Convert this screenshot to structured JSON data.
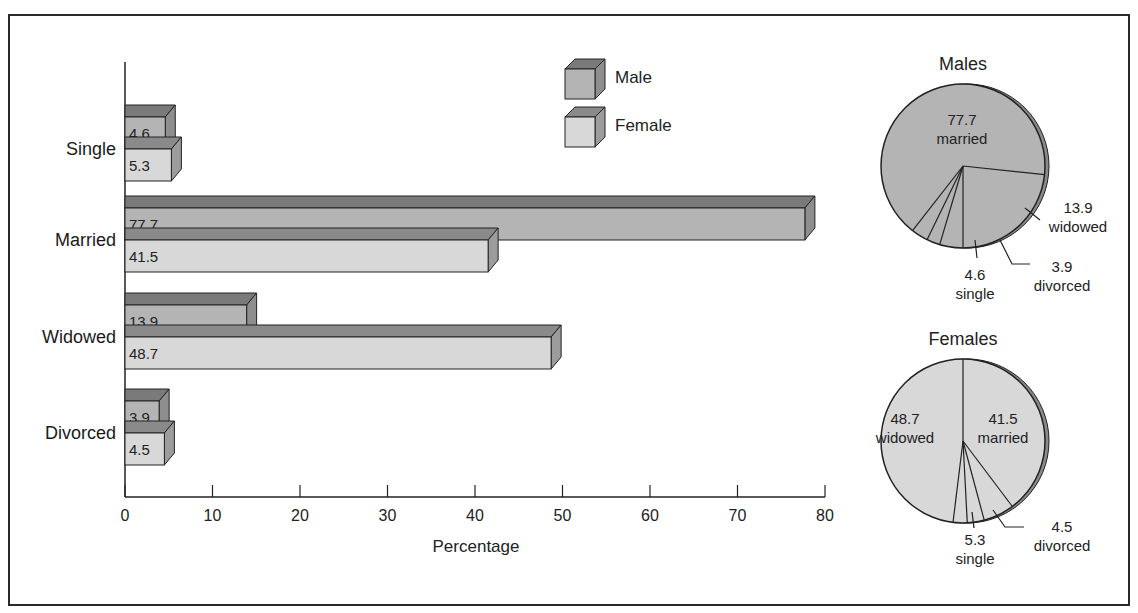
{
  "chart_data": [
    {
      "type": "bar",
      "orientation": "horizontal",
      "style": "3d",
      "categories": [
        "Single",
        "Married",
        "Widowed",
        "Divorced"
      ],
      "series": [
        {
          "name": "Male",
          "values": [
            4.6,
            77.7,
            13.9,
            3.9
          ],
          "color": "#b4b4b4",
          "top_color": "#7a7a7a",
          "side_color": "#8e8e8e"
        },
        {
          "name": "Female",
          "values": [
            5.3,
            41.5,
            48.7,
            4.5
          ],
          "color": "#d8d8d8",
          "top_color": "#8a8a8a",
          "side_color": "#9c9c9c"
        }
      ],
      "value_labels": {
        "Male": [
          "4.6",
          "77.7",
          "13.9",
          "3.9"
        ],
        "Female": [
          "5.3",
          "41.5",
          "48.7",
          "4.5"
        ]
      },
      "xlabel": "Percentage",
      "ylabel": "",
      "xlim": [
        0,
        80
      ],
      "xticks": [
        "0",
        "10",
        "20",
        "30",
        "40",
        "50",
        "60",
        "70",
        "80"
      ],
      "grid": false,
      "legend": {
        "position": "top-center",
        "entries": [
          "Male",
          "Female"
        ]
      }
    },
    {
      "type": "pie",
      "title": "Males",
      "slices": [
        {
          "label": "married",
          "value": 77.7,
          "text": "77.7"
        },
        {
          "label": "widowed",
          "value": 13.9,
          "text": "13.9"
        },
        {
          "label": "divorced",
          "value": 3.9,
          "text": "3.9"
        },
        {
          "label": "single",
          "value": 4.6,
          "text": "4.6"
        }
      ],
      "color": "#b4b4b4"
    },
    {
      "type": "pie",
      "title": "Females",
      "slices": [
        {
          "label": "married",
          "value": 41.5,
          "text": "41.5"
        },
        {
          "label": "divorced",
          "value": 4.5,
          "text": "4.5"
        },
        {
          "label": "single",
          "value": 5.3,
          "text": "5.3"
        },
        {
          "label": "widowed",
          "value": 48.7,
          "text": "48.7"
        }
      ],
      "color": "#d8d8d8"
    }
  ],
  "labels": {
    "legend_male": "Male",
    "legend_female": "Female",
    "xlabel": "Percentage",
    "males_title": "Males",
    "females_title": "Females"
  }
}
